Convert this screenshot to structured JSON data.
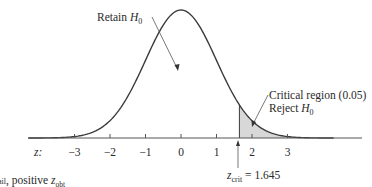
{
  "figure": {
    "retain_label": "Retain ",
    "retain_var": "H",
    "retain_sub": "0",
    "critical_label": "Critical region (0.05)",
    "reject_label": "Reject ",
    "reject_var": "H",
    "reject_sub": "0",
    "axis_label": "z:",
    "zcrit_var": "z",
    "zcrit_sub": "crit",
    "zcrit_value": " = 1.645",
    "caption_left": "ail",
    "caption_mid": ", positive ",
    "caption_var": "z",
    "caption_sub": "obt",
    "ticks": [
      {
        "value": -3,
        "label": "−3"
      },
      {
        "value": -2,
        "label": "−2"
      },
      {
        "value": -1,
        "label": "−1"
      },
      {
        "value": 0,
        "label": "0"
      },
      {
        "value": 1,
        "label": "1"
      },
      {
        "value": 2,
        "label": "2"
      },
      {
        "value": 3,
        "label": "3"
      }
    ],
    "colors": {
      "curve": "#3a3a3a",
      "shade": "#d8d8d8",
      "axis": "#555555"
    },
    "critical_z": 1.645,
    "alpha": 0.05
  }
}
